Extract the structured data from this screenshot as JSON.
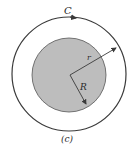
{
  "figure": {
    "caption": "(c)",
    "labels": {
      "curve": "C",
      "outer_radius": "r",
      "inner_radius": "R"
    },
    "colors": {
      "stroke": "#3a3a3a",
      "disk_fill": "#bdbdbd",
      "background": "#ffffff"
    },
    "geometry": {
      "center": [
        69,
        74
      ],
      "outer_circle_radius": 57,
      "inner_disk_radius": 37
    }
  }
}
